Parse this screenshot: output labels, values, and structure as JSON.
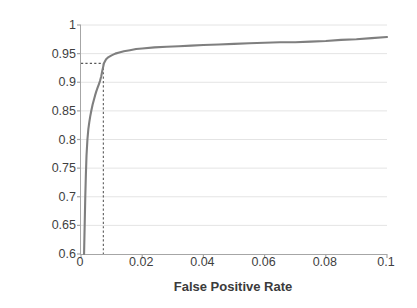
{
  "chart_data": {
    "type": "line",
    "title": "",
    "subtitle": "",
    "xlabel": "False Positive Rate",
    "ylabel": "True Positive Rate",
    "xlim": [
      0,
      0.1
    ],
    "ylim": [
      0.6,
      1
    ],
    "xticks": [
      0,
      0.02,
      0.04,
      0.06,
      0.08,
      0.1
    ],
    "xtick_labels": [
      "0",
      "0.02",
      "0.04",
      "0.06",
      "0.08",
      "0.1"
    ],
    "yticks": [
      0.6,
      0.65,
      0.7,
      0.75,
      0.8,
      0.85,
      0.9,
      0.95,
      1
    ],
    "ytick_labels": [
      "0.6",
      "0.65",
      "0.7",
      "0.75",
      "0.8",
      "0.85",
      "0.9",
      "0.95",
      "1"
    ],
    "grid": "horizontal",
    "legend": "none",
    "series": [
      {
        "name": "ROC curve",
        "color": "#7f7f7f",
        "x": [
          0.001,
          0.0012,
          0.0014,
          0.0016,
          0.0018,
          0.0021,
          0.0024,
          0.0027,
          0.003,
          0.0034,
          0.0038,
          0.0042,
          0.0046,
          0.005,
          0.0054,
          0.0058,
          0.0062,
          0.0066,
          0.007,
          0.0075,
          0.0082,
          0.009,
          0.01,
          0.0112,
          0.0125,
          0.014,
          0.016,
          0.018,
          0.02,
          0.024,
          0.028,
          0.032,
          0.036,
          0.04,
          0.045,
          0.05,
          0.055,
          0.06,
          0.065,
          0.07,
          0.075,
          0.08,
          0.085,
          0.09,
          0.095,
          0.1
        ],
        "y": [
          0.6,
          0.65,
          0.7,
          0.74,
          0.772,
          0.8,
          0.818,
          0.83,
          0.84,
          0.851,
          0.861,
          0.869,
          0.877,
          0.884,
          0.89,
          0.896,
          0.902,
          0.91,
          0.921,
          0.933,
          0.94,
          0.944,
          0.947,
          0.95,
          0.952,
          0.954,
          0.956,
          0.958,
          0.959,
          0.961,
          0.962,
          0.963,
          0.964,
          0.965,
          0.966,
          0.967,
          0.968,
          0.969,
          0.97,
          0.97,
          0.971,
          0.972,
          0.974,
          0.975,
          0.977,
          0.979
        ]
      }
    ],
    "annotations": {
      "operating_point": {
        "x": 0.0073,
        "y": 0.933,
        "style": "dotted-crosshair",
        "color": "#595959",
        "label": ""
      }
    }
  }
}
